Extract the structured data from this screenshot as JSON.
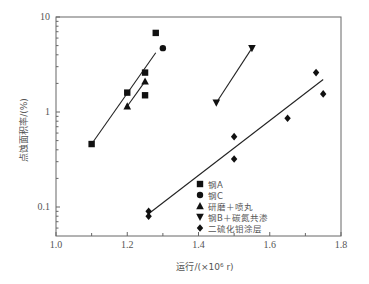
{
  "chart_data": {
    "type": "scatter",
    "title": "",
    "xlabel": "运行/(×10⁶ r)",
    "ylabel": "点蚀面积率/(%)",
    "xlim": [
      1.0,
      1.8
    ],
    "ylim": [
      0.055,
      10
    ],
    "yscale": "log",
    "x_ticks": [
      1.0,
      1.2,
      1.4,
      1.6,
      1.8
    ],
    "x_tick_labels": [
      "1.0",
      "1.2",
      "1.4",
      "1.6",
      "1.8"
    ],
    "x_minor_ticks": [
      1.1,
      1.3,
      1.5,
      1.7
    ],
    "y_ticks": [
      10,
      1,
      0.1
    ],
    "y_tick_labels": [
      "10",
      "1",
      "0.1"
    ],
    "grid": false,
    "legend_position": "lower center inside",
    "series": [
      {
        "name": "钢A",
        "marker": "square",
        "points": [
          [
            1.1,
            0.46
          ],
          [
            1.2,
            1.6
          ],
          [
            1.25,
            2.6
          ],
          [
            1.25,
            1.5
          ],
          [
            1.28,
            6.8
          ]
        ]
      },
      {
        "name": "钢C",
        "marker": "circle",
        "points": [
          [
            1.3,
            4.7
          ]
        ]
      },
      {
        "name": "研磨＋喷丸",
        "marker": "triangle-up",
        "points": [
          [
            1.2,
            1.15
          ],
          [
            1.25,
            2.1
          ]
        ]
      },
      {
        "name": "钢B＋碳氮共渗",
        "marker": "triangle-down",
        "points": [
          [
            1.45,
            1.25
          ],
          [
            1.55,
            4.7
          ]
        ]
      },
      {
        "name": "二硫化钼涂层",
        "marker": "diamond",
        "points": [
          [
            1.26,
            0.09
          ],
          [
            1.26,
            0.08
          ],
          [
            1.5,
            0.55
          ],
          [
            1.5,
            0.32
          ],
          [
            1.65,
            0.86
          ],
          [
            1.73,
            2.6
          ],
          [
            1.75,
            1.55
          ]
        ]
      }
    ],
    "fit_lines": [
      {
        "group": "钢A/钢C",
        "from": [
          1.1,
          0.46
        ],
        "to": [
          1.28,
          4.2
        ]
      },
      {
        "group": "研磨＋喷丸",
        "from": [
          1.2,
          1.15
        ],
        "to": [
          1.25,
          2.1
        ]
      },
      {
        "group": "钢B＋碳氮共渗",
        "from": [
          1.45,
          1.25
        ],
        "to": [
          1.55,
          4.7
        ]
      },
      {
        "group": "二硫化钼涂层",
        "from": [
          1.26,
          0.085
        ],
        "to": [
          1.75,
          2.2
        ]
      }
    ]
  },
  "colors": {
    "axis": "#666666",
    "marker": "#111111",
    "line": "#222222",
    "text": "#555555"
  }
}
